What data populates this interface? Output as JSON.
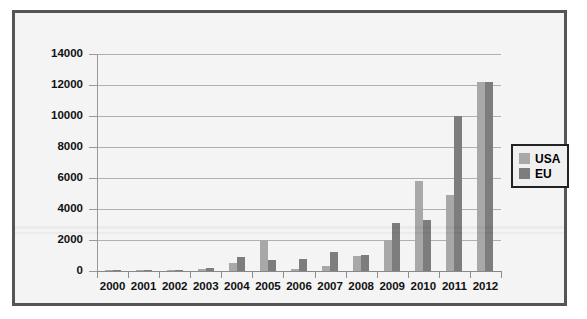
{
  "chart_data": {
    "type": "bar",
    "title": "",
    "xlabel": "",
    "ylabel": "",
    "categories": [
      "2000",
      "2001",
      "2002",
      "2003",
      "2004",
      "2005",
      "2006",
      "2007",
      "2008",
      "2009",
      "2010",
      "2011",
      "2012"
    ],
    "series": [
      {
        "name": "USA",
        "color": "#a8a8a8",
        "values": [
          50,
          80,
          60,
          150,
          500,
          2000,
          100,
          300,
          950,
          2000,
          5800,
          4900,
          12200
        ]
      },
      {
        "name": "EU",
        "color": "#7d7d7d",
        "values": [
          50,
          80,
          60,
          170,
          900,
          700,
          750,
          1200,
          1050,
          3100,
          3300,
          10000,
          12200
        ]
      }
    ],
    "ylim": [
      0,
      14000
    ],
    "ytick_values": [
      0,
      2000,
      4000,
      6000,
      8000,
      10000,
      12000,
      14000
    ],
    "ytick_labels": [
      "0",
      "2000",
      "4000",
      "6000",
      "8000",
      "10000",
      "12000",
      "14000"
    ],
    "grid": true,
    "legend_position": "right"
  },
  "legend": {
    "entries": [
      {
        "label": "USA",
        "color": "#a8a8a8"
      },
      {
        "label": "EU",
        "color": "#7d7d7d"
      }
    ]
  },
  "colors": {
    "frame_border": "#555555",
    "plot_background": "#f4f4f4",
    "gridline": "#b0b0b0",
    "usa": "#a8a8a8",
    "eu": "#7d7d7d"
  }
}
